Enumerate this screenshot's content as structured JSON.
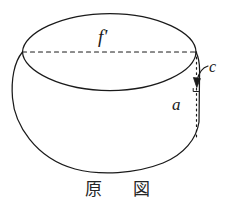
{
  "figure": {
    "caption": "原 図",
    "labels": {
      "top_axis": "f'",
      "height": "a",
      "rim_thickness": "c"
    },
    "colors": {
      "ink": "#1a1a1a",
      "background": "#ffffff"
    },
    "annotations": {
      "top_axis_line_style": "dashed",
      "height_line_style": "dotted",
      "rim_pointer_style": "curved-arrow"
    },
    "shape": "barrel-with-elliptical-top-rim"
  }
}
